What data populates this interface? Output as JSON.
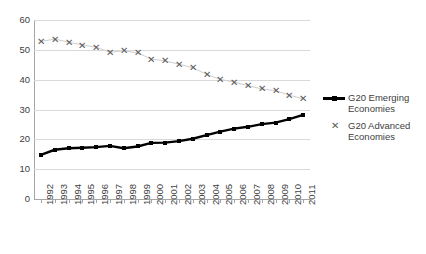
{
  "chart_data": {
    "type": "line",
    "title": "",
    "subtitle": "",
    "xlabel": "",
    "ylabel": "",
    "ylim": [
      0,
      60
    ],
    "yticks": [
      0,
      10,
      20,
      30,
      40,
      50,
      60
    ],
    "grid": true,
    "legend_position": "right",
    "categories": [
      "1992",
      "1993",
      "1994",
      "1995",
      "1996",
      "1997",
      "1998",
      "1999",
      "2000",
      "2001",
      "2002",
      "2003",
      "2004",
      "2005",
      "2006",
      "2007",
      "2008",
      "2009",
      "2010",
      "2011"
    ],
    "series": [
      {
        "name": "G20 Emerging Economies",
        "marker": "square",
        "color": "#000000",
        "values": [
          14.8,
          16.5,
          17.0,
          17.2,
          17.4,
          17.8,
          17.0,
          17.6,
          18.8,
          18.9,
          19.4,
          20.2,
          21.4,
          22.6,
          23.6,
          24.2,
          25.1,
          25.6,
          26.8,
          28.2
        ]
      },
      {
        "name": "G20 Advanced Economies",
        "marker": "x",
        "color": "#5b5b5b",
        "values": [
          52.8,
          53.6,
          52.6,
          51.6,
          50.9,
          49.2,
          49.7,
          49.0,
          46.9,
          46.3,
          45.2,
          44.0,
          41.8,
          40.1,
          39.2,
          38.0,
          36.9,
          36.3,
          34.8,
          33.6
        ]
      }
    ]
  },
  "legend": {
    "items": [
      {
        "label": "G20 Emerging Economies",
        "key": "line-square-marker"
      },
      {
        "label": "G20 Advanced Economies",
        "key": "x-marker"
      }
    ]
  }
}
